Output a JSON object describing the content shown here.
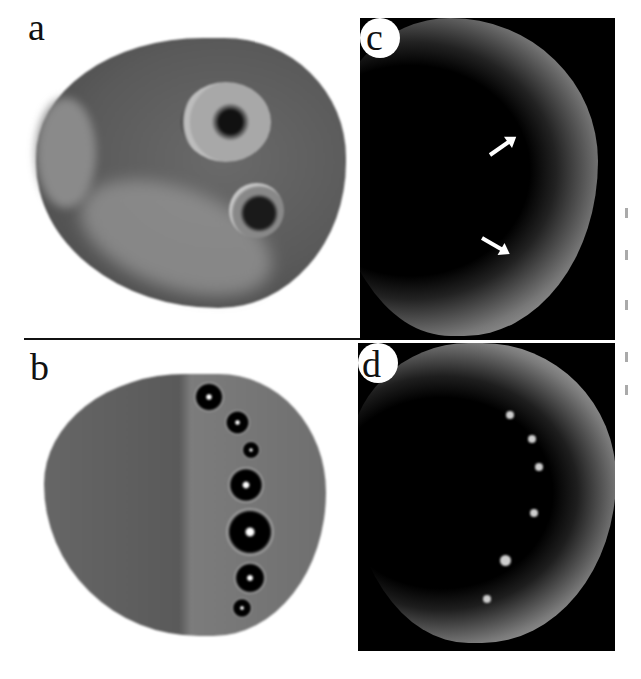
{
  "figure": {
    "panels": [
      {
        "id": "a",
        "label": "a",
        "description": "Butterfly wing, dorsal view with two eyespots"
      },
      {
        "id": "b",
        "label": "b",
        "description": "Butterfly wing, ventral view with row of seven eyespots"
      },
      {
        "id": "c",
        "label": "c",
        "description": "Wing disc fluorescence image with two arrows marking spots"
      },
      {
        "id": "d",
        "label": "d",
        "description": "Wing disc fluorescence image with bright spots along margin"
      }
    ],
    "colors": {
      "background": "#ffffff",
      "panel_dark": "#000000",
      "divider": "#111111"
    }
  }
}
